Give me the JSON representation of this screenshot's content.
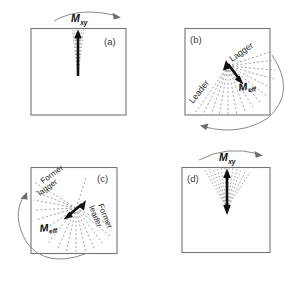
{
  "figure": {
    "caption_present": false,
    "background_color": "#ffffff",
    "frame_color": "#757575",
    "dash_color": "#9a9a9a",
    "vector_color": "#111111",
    "arc_color": "#8a8a8a"
  },
  "panels": [
    {
      "id": "a",
      "label": "(a)",
      "vector_symbol": "M",
      "vector_subscript": "xy",
      "vector_label_position": "above-box",
      "rotation_arc": "clockwise",
      "fan_spread_degrees": 10,
      "fan_orientation_degrees": 0,
      "side_labels": []
    },
    {
      "id": "b",
      "label": "(b)",
      "vector_symbol": "M",
      "vector_subscript": "eff",
      "vector_label_position": "inside-box",
      "rotation_arc": "counterclockwise",
      "fan_spread_degrees": 150,
      "fan_orientation_degrees": 35,
      "side_labels": [
        "Leader",
        "Lagger"
      ]
    },
    {
      "id": "c",
      "label": "(c)",
      "vector_symbol": "M",
      "vector_subscript": "eff",
      "vector_label_position": "inside-box",
      "rotation_arc": "counterclockwise",
      "fan_spread_degrees": 190,
      "fan_orientation_degrees": -25,
      "side_labels": [
        "Former lagger",
        "Former leader"
      ]
    },
    {
      "id": "d",
      "label": "(d)",
      "vector_symbol": "M",
      "vector_subscript": "xy",
      "vector_label_position": "above-box",
      "rotation_arc": "clockwise",
      "fan_spread_degrees": 60,
      "fan_orientation_degrees": 0,
      "side_labels": []
    }
  ],
  "labels": {
    "panel_a": "(a)",
    "panel_b": "(b)",
    "panel_c": "(c)",
    "panel_d": "(d)",
    "m_symbol": "M",
    "sub_xy": "xy",
    "sub_eff": "eff",
    "leader": "Leader",
    "lagger": "Lagger",
    "former_word": "Former",
    "lagger_lower": "lagger",
    "leader_lower": "leader"
  }
}
